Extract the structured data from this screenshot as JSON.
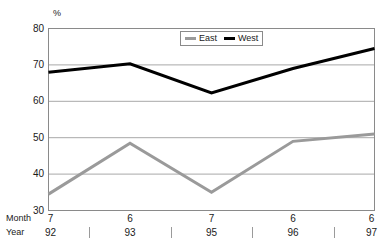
{
  "chart_data": {
    "type": "line",
    "title": "",
    "xlabel": "",
    "ylabel": "%",
    "ylim": [
      30,
      80
    ],
    "yticks": [
      30,
      40,
      50,
      60,
      70,
      80
    ],
    "grid": true,
    "legend_position": "top-center",
    "categories": [
      "7 92",
      "6 93",
      "7 95",
      "6 96",
      "6 97"
    ],
    "x_axis_rows": [
      {
        "row_label": "Month",
        "values": [
          "7",
          "6",
          "7",
          "6",
          "6"
        ]
      },
      {
        "row_label": "Year",
        "values": [
          "92",
          "93",
          "95",
          "96",
          "97"
        ]
      }
    ],
    "series": [
      {
        "name": "East",
        "color": "#9a9a9a",
        "values": [
          34.5,
          48.5,
          35.0,
          49.0,
          51.0
        ]
      },
      {
        "name": "West",
        "color": "#000000",
        "values": [
          68.0,
          70.3,
          62.3,
          69.0,
          74.5
        ]
      }
    ]
  },
  "legend": {
    "entries": [
      {
        "label": "East"
      },
      {
        "label": "West"
      }
    ]
  },
  "axis": {
    "unit_label": "%",
    "month_row_label": "Month",
    "year_row_label": "Year",
    "y_tick_labels": [
      "80",
      "70",
      "60",
      "50",
      "40",
      "30"
    ]
  }
}
